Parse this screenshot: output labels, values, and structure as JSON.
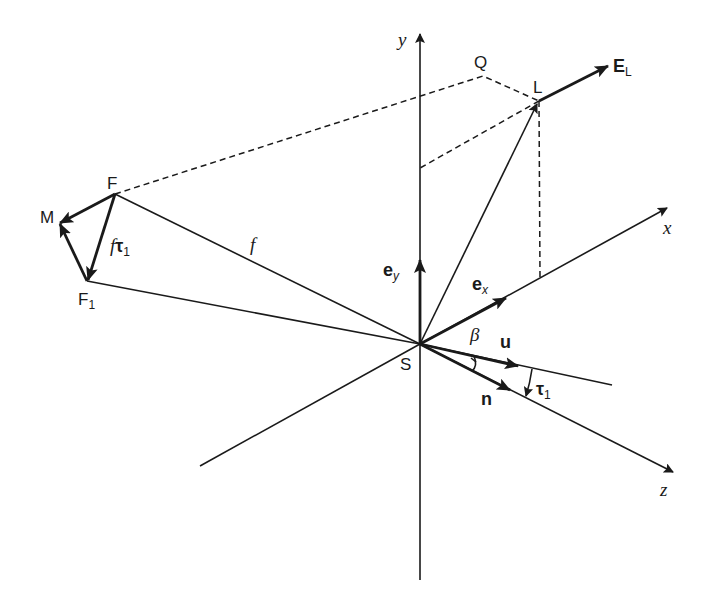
{
  "diagram": {
    "type": "3D vector geometry diagram",
    "axes": {
      "x": "x",
      "y": "y",
      "z": "z"
    },
    "points": {
      "origin": "S",
      "Q": "Q",
      "L": "L",
      "F": "F",
      "M": "M",
      "F1": "F",
      "F1_sub": "1"
    },
    "vectors": {
      "E_L": "E",
      "E_L_sub": "L",
      "e_y": "e",
      "e_y_sub": "y",
      "e_x": "e",
      "e_x_sub": "x",
      "u": "u",
      "n": "n",
      "tau1": "τ",
      "tau1_sub": "1",
      "f_tau1_f": "f",
      "f_tau1_tau": "τ",
      "f_tau1_sub": "1"
    },
    "labels": {
      "f": "f",
      "beta": "β"
    },
    "colors": {
      "stroke": "#1a1a1a",
      "background": "#ffffff"
    }
  }
}
